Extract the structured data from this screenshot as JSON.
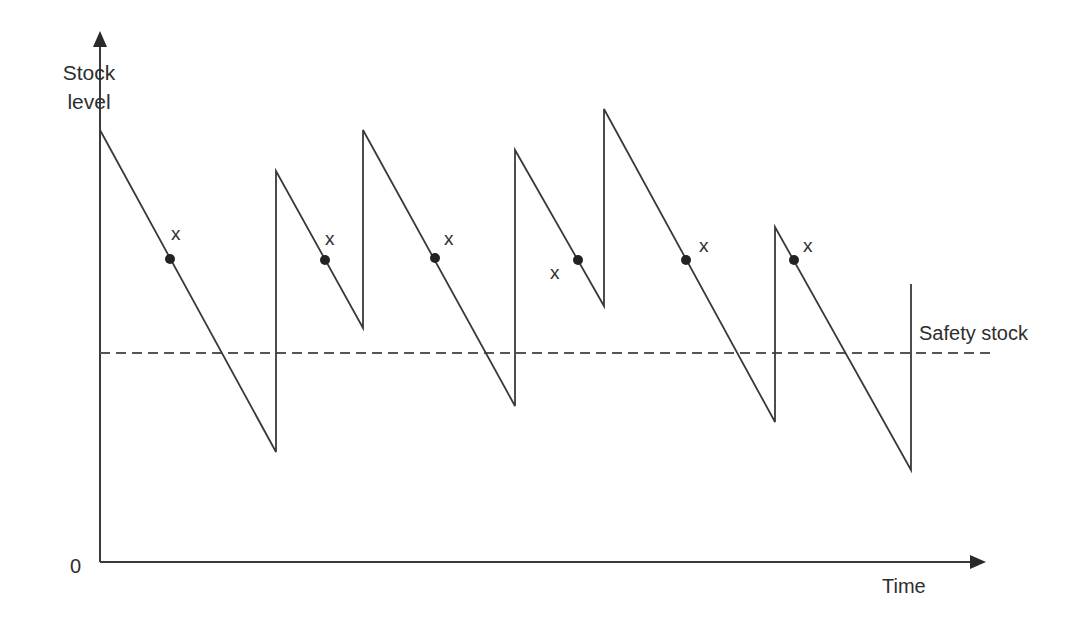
{
  "diagram": {
    "type": "inventory-sawtooth",
    "y_axis_label_line1": "Stock",
    "y_axis_label_line2": "level",
    "x_axis_label": "Time",
    "origin_label": "0",
    "safety_stock_label": "Safety stock",
    "reorder_marker_label": "x",
    "colors": {
      "line": "#3a3a3a",
      "axis": "#3a3a3a",
      "dash": "#555555",
      "dot": "#222222"
    }
  },
  "chart_data": {
    "type": "line",
    "title": "",
    "xlabel": "Time",
    "ylabel": "Stock level",
    "grid": false,
    "stock_path_px": [
      [
        100,
        130
      ],
      [
        276,
        452
      ],
      [
        276,
        171
      ],
      [
        363,
        328
      ],
      [
        363,
        130
      ],
      [
        515,
        406
      ],
      [
        515,
        150
      ],
      [
        604,
        306
      ],
      [
        604,
        109
      ],
      [
        775,
        422
      ],
      [
        775,
        227
      ],
      [
        911,
        470
      ],
      [
        911,
        284
      ]
    ],
    "safety_stock_y_px": 353,
    "reorder_points_px": [
      [
        170,
        259
      ],
      [
        325,
        260
      ],
      [
        435,
        258
      ],
      [
        578,
        260
      ],
      [
        686,
        260
      ],
      [
        794,
        260
      ]
    ],
    "reorder_labels": [
      {
        "text": "x",
        "x": 177,
        "y": 236
      },
      {
        "text": "x",
        "x": 331,
        "y": 241
      },
      {
        "text": "x",
        "x": 450,
        "y": 241
      },
      {
        "text": "x",
        "x": 556,
        "y": 275
      },
      {
        "text": "x",
        "x": 705,
        "y": 248
      },
      {
        "text": "x",
        "x": 809,
        "y": 248
      }
    ]
  }
}
